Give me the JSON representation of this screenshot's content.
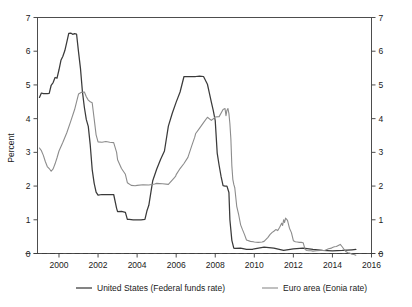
{
  "chart_data": {
    "type": "line",
    "title": "",
    "xlabel": "",
    "ylabel": "Percent",
    "xlim": [
      1998.9,
      2016.0
    ],
    "ylim": [
      0,
      7
    ],
    "grid": false,
    "legend_position": "bottom",
    "y_ticks": [
      "0",
      "1",
      "2",
      "3",
      "4",
      "5",
      "6",
      "7"
    ],
    "y_ticks_right": [
      "0",
      "1",
      "2",
      "3",
      "4",
      "5",
      "6",
      "7"
    ],
    "x_ticks": [
      "2000",
      "2002",
      "2004",
      "2006",
      "2008",
      "2010",
      "2012",
      "2014",
      "2016"
    ],
    "zero_reference_line": 0,
    "series": [
      {
        "name": "United States (Federal funds rate)",
        "color": "#3a3a3a",
        "width": 1.25,
        "x": [
          1999.0,
          1999.1,
          1999.2,
          1999.3,
          1999.4,
          1999.5,
          1999.6,
          1999.7,
          1999.8,
          1999.9,
          2000.0,
          2000.1,
          2000.2,
          2000.3,
          2000.4,
          2000.5,
          2000.6,
          2000.7,
          2000.8,
          2000.9,
          2001.0,
          2001.1,
          2001.2,
          2001.3,
          2001.4,
          2001.5,
          2001.6,
          2001.7,
          2001.8,
          2001.9,
          2002.0,
          2002.2,
          2002.4,
          2002.6,
          2002.8,
          2002.95,
          2003.0,
          2003.2,
          2003.4,
          2003.5,
          2003.6,
          2003.8,
          2004.0,
          2004.2,
          2004.4,
          2004.5,
          2004.6,
          2004.8,
          2005.0,
          2005.2,
          2005.4,
          2005.6,
          2005.8,
          2006.0,
          2006.2,
          2006.4,
          2006.5,
          2006.6,
          2006.8,
          2007.0,
          2007.2,
          2007.4,
          2007.6,
          2007.7,
          2007.8,
          2007.9,
          2008.0,
          2008.1,
          2008.2,
          2008.3,
          2008.4,
          2008.5,
          2008.6,
          2008.7,
          2008.75,
          2008.85,
          2008.95,
          2009.0,
          2009.3,
          2009.6,
          2009.9,
          2010.0,
          2010.5,
          2011.0,
          2011.5,
          2012.0,
          2012.5,
          2013.0,
          2013.5,
          2014.0,
          2014.5,
          2015.0,
          2015.2
        ],
        "y": [
          4.63,
          4.76,
          4.74,
          4.74,
          4.74,
          4.75,
          4.99,
          5.07,
          5.22,
          5.2,
          5.45,
          5.73,
          5.85,
          6.02,
          6.27,
          6.53,
          6.54,
          6.5,
          6.52,
          6.51,
          5.98,
          5.49,
          4.8,
          4.33,
          3.97,
          3.77,
          3.22,
          2.49,
          2.09,
          1.82,
          1.73,
          1.75,
          1.75,
          1.75,
          1.75,
          1.34,
          1.24,
          1.25,
          1.22,
          1.01,
          1.01,
          1.0,
          1.0,
          1.0,
          1.01,
          1.26,
          1.43,
          2.16,
          2.5,
          2.79,
          3.04,
          3.78,
          4.16,
          4.49,
          4.79,
          5.25,
          5.25,
          5.25,
          5.25,
          5.25,
          5.26,
          5.25,
          5.02,
          4.76,
          4.49,
          4.24,
          3.94,
          2.98,
          2.61,
          2.28,
          2.01,
          2.0,
          2.0,
          1.81,
          1.0,
          0.39,
          0.16,
          0.15,
          0.16,
          0.12,
          0.12,
          0.14,
          0.19,
          0.16,
          0.09,
          0.14,
          0.16,
          0.12,
          0.09,
          0.08,
          0.09,
          0.11,
          0.12
        ]
      },
      {
        "name": "Euro area (Eonia rate)",
        "color": "#8c8c8c",
        "width": 1.1,
        "x": [
          1999.0,
          1999.1,
          1999.2,
          1999.3,
          1999.4,
          1999.5,
          1999.6,
          1999.7,
          1999.8,
          1999.9,
          2000.0,
          2000.2,
          2000.4,
          2000.6,
          2000.8,
          2000.9,
          2001.0,
          2001.15,
          2001.3,
          2001.4,
          2001.5,
          2001.6,
          2001.7,
          2001.8,
          2001.9,
          2002.0,
          2002.2,
          2002.4,
          2002.6,
          2002.8,
          2002.95,
          2003.0,
          2003.2,
          2003.4,
          2003.5,
          2003.7,
          2003.9,
          2004.0,
          2004.3,
          2004.6,
          2004.9,
          2005.0,
          2005.3,
          2005.6,
          2005.9,
          2005.98,
          2006.0,
          2006.2,
          2006.4,
          2006.6,
          2006.8,
          2006.95,
          2007.0,
          2007.2,
          2007.4,
          2007.6,
          2007.8,
          2007.95,
          2008.0,
          2008.2,
          2008.4,
          2008.5,
          2008.55,
          2008.6,
          2008.65,
          2008.7,
          2008.75,
          2008.8,
          2008.85,
          2008.9,
          2008.95,
          2009.0,
          2009.1,
          2009.2,
          2009.3,
          2009.4,
          2009.5,
          2009.6,
          2009.8,
          2009.95,
          2010.0,
          2010.2,
          2010.4,
          2010.5,
          2010.6,
          2010.7,
          2010.8,
          2010.9,
          2011.0,
          2011.1,
          2011.2,
          2011.3,
          2011.4,
          2011.45,
          2011.5,
          2011.55,
          2011.6,
          2011.7,
          2011.8,
          2011.9,
          2012.0,
          2012.1,
          2012.2,
          2012.3,
          2012.4,
          2012.5,
          2012.6,
          2012.7,
          2012.8,
          2012.9,
          2013.0,
          2013.2,
          2013.4,
          2013.6,
          2013.8,
          2013.95,
          2014.0,
          2014.1,
          2014.2,
          2014.3,
          2014.4,
          2014.5,
          2014.6,
          2014.7,
          2014.8,
          2014.9,
          2015.0,
          2015.1,
          2015.2
        ],
        "y": [
          3.13,
          3.05,
          2.91,
          2.73,
          2.58,
          2.52,
          2.44,
          2.51,
          2.66,
          2.84,
          3.04,
          3.3,
          3.58,
          3.92,
          4.27,
          4.5,
          4.73,
          4.78,
          4.79,
          4.65,
          4.55,
          4.5,
          4.47,
          4.0,
          3.52,
          3.31,
          3.3,
          3.32,
          3.3,
          3.29,
          3.0,
          2.78,
          2.52,
          2.35,
          2.1,
          2.02,
          2.01,
          2.02,
          2.04,
          2.03,
          2.06,
          2.08,
          2.07,
          2.05,
          2.24,
          2.3,
          2.34,
          2.52,
          2.67,
          2.85,
          3.2,
          3.45,
          3.56,
          3.72,
          3.88,
          4.04,
          3.95,
          4.02,
          4.05,
          4.06,
          4.27,
          4.3,
          4.09,
          4.25,
          4.3,
          4.15,
          3.85,
          3.4,
          2.6,
          2.2,
          2.05,
          1.95,
          1.4,
          1.15,
          0.85,
          0.7,
          0.56,
          0.4,
          0.36,
          0.35,
          0.34,
          0.33,
          0.34,
          0.36,
          0.42,
          0.48,
          0.56,
          0.62,
          0.66,
          0.71,
          0.68,
          0.78,
          0.9,
          0.83,
          1.0,
          0.92,
          1.05,
          0.98,
          0.75,
          0.62,
          0.38,
          0.35,
          0.34,
          0.33,
          0.33,
          0.32,
          0.12,
          0.09,
          0.08,
          0.08,
          0.07,
          0.08,
          0.09,
          0.09,
          0.14,
          0.16,
          0.18,
          0.2,
          0.21,
          0.24,
          0.27,
          0.2,
          0.12,
          0.05,
          0.02,
          0.01,
          -0.02,
          -0.03,
          -0.05
        ]
      }
    ]
  },
  "axes": {
    "y_label": "Percent"
  },
  "legend": {
    "items": [
      {
        "label": "United States (Federal funds rate)",
        "color": "#3a3a3a"
      },
      {
        "label": "Euro area (Eonia rate)",
        "color": "#8c8c8c"
      }
    ]
  }
}
